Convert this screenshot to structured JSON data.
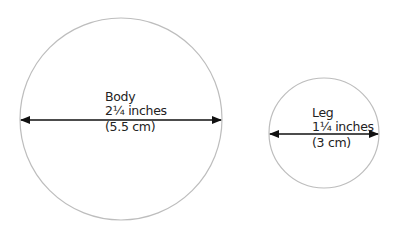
{
  "colors": {
    "circle_stroke": "#bdbdbd",
    "arrow": "#111111",
    "text": "#222222"
  },
  "body": {
    "name": "Body",
    "inches": "2¼ inches",
    "cm": "(5.5 cm)"
  },
  "leg": {
    "name": "Leg",
    "inches": "1¼ inches",
    "cm": "(3 cm)"
  }
}
